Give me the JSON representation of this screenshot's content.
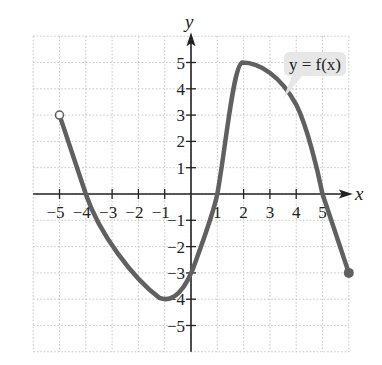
{
  "chart_data": {
    "type": "line",
    "title": "",
    "xlabel": "x",
    "ylabel": "y",
    "xlim": [
      -6,
      6
    ],
    "ylim": [
      -6,
      6
    ],
    "grid": true,
    "grid_style": "dotted",
    "x_ticks": [
      -5,
      -4,
      -3,
      -2,
      -1,
      1,
      2,
      3,
      4,
      5
    ],
    "y_ticks": [
      -5,
      -4,
      -3,
      -2,
      -1,
      1,
      2,
      3,
      4,
      5
    ],
    "x_tick_labels": [
      "−5",
      "−4",
      "−3",
      "−2",
      "−1",
      "1",
      "2",
      "3",
      "4",
      "5"
    ],
    "y_tick_labels": [
      "−5",
      "−4",
      "−3",
      "−2",
      "−1",
      "1",
      "2",
      "3",
      "4",
      "5"
    ],
    "series": [
      {
        "name": "y = f(x)",
        "points": [
          [
            -5,
            3
          ],
          [
            -4,
            0
          ],
          [
            -3,
            -2
          ],
          [
            -2,
            -3.3
          ],
          [
            -1,
            -4
          ],
          [
            0,
            -3
          ],
          [
            1,
            0
          ],
          [
            2,
            5
          ],
          [
            3,
            4.6
          ],
          [
            4,
            3.5
          ],
          [
            5,
            0
          ],
          [
            6,
            -3
          ]
        ],
        "start": {
          "x": -5,
          "y": 3,
          "marker": "open-circle"
        },
        "end": {
          "x": 6,
          "y": -3,
          "marker": "closed-circle"
        },
        "color": "#606060"
      }
    ],
    "annotations": [
      {
        "text": "y = f(x)",
        "type": "callout",
        "anchor": [
          3,
          4.3
        ]
      }
    ]
  },
  "labels": {
    "x_axis": "x",
    "y_axis": "y",
    "callout": "y = f(x)"
  }
}
